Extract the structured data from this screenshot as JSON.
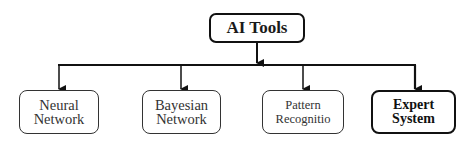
{
  "diagram": {
    "type": "hierarchy",
    "root": {
      "label": "AI Tools",
      "emphasis": "bold"
    },
    "children": [
      {
        "lines": [
          "Neural",
          "Network"
        ],
        "emphasis": "normal"
      },
      {
        "lines": [
          "Bayesian",
          "Network"
        ],
        "emphasis": "normal"
      },
      {
        "lines": [
          "Pattern",
          "Recognitio"
        ],
        "emphasis": "normal"
      },
      {
        "lines": [
          "Expert",
          "System"
        ],
        "emphasis": "bold"
      }
    ],
    "colors": {
      "stroke": "#111111",
      "text": "#1a1a1a",
      "background": "#ffffff"
    }
  }
}
